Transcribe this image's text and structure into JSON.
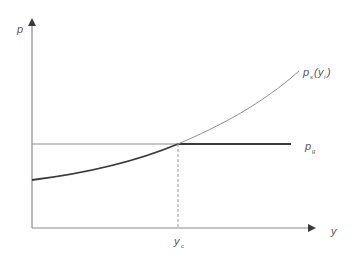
{
  "diagram": {
    "type": "economics-supply-price-diagram",
    "axes": {
      "y_label": "p",
      "x_label": "y"
    },
    "curves": [
      {
        "id": "supply-curve",
        "label_main": "p",
        "label_sub": "s",
        "label_arg_open": "(",
        "label_arg_main": "y",
        "label_arg_sub": "i",
        "label_arg_close": ")",
        "style": "thin-gray, convex rising"
      },
      {
        "id": "price-line",
        "label_main": "p",
        "label_sub": "g",
        "style": "thin horizontal, thick beyond y_c"
      }
    ],
    "marker": {
      "label_main": "y",
      "label_sub": "c",
      "style": "dashed vertical drop to x-axis"
    },
    "colors": {
      "axis": "#8a8a8a",
      "thin_line": "#8f8f8f",
      "thick_line": "#3a3a3a",
      "dashed": "#9a9a9a",
      "text": "#555555"
    }
  }
}
